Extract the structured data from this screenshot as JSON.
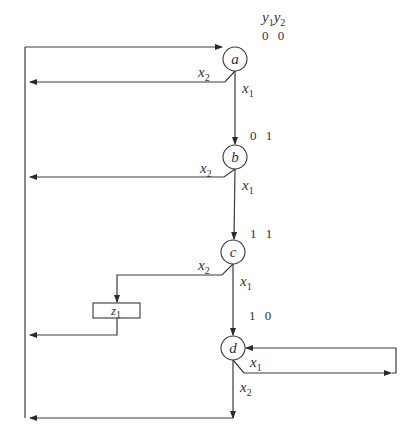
{
  "diagram": {
    "type": "ASM / state transition chart",
    "state_code_header": {
      "var1": "y",
      "sub1": "1",
      "var2": "y",
      "sub2": "2"
    },
    "states": [
      {
        "name": "a",
        "code": "0 0"
      },
      {
        "name": "b",
        "code": "0 1"
      },
      {
        "name": "c",
        "code": "1 1"
      },
      {
        "name": "d",
        "code": "1 0"
      }
    ],
    "edge_labels": {
      "a_x1": {
        "var": "x",
        "sub": "1"
      },
      "a_x2": {
        "var": "x",
        "sub": "2"
      },
      "b_x1": {
        "var": "x",
        "sub": "1"
      },
      "b_x2": {
        "var": "x",
        "sub": "2"
      },
      "c_x1": {
        "var": "x",
        "sub": "1"
      },
      "c_x2": {
        "var": "x",
        "sub": "2"
      },
      "d_x1": {
        "var": "x",
        "sub": "1"
      },
      "d_x2": {
        "var": "x",
        "sub": "2"
      }
    },
    "output_box": {
      "var": "z",
      "sub": "1"
    },
    "transitions": [
      {
        "from": "a",
        "cond": "x1",
        "to": "b"
      },
      {
        "from": "a",
        "cond": "x2",
        "to": "a"
      },
      {
        "from": "b",
        "cond": "x1",
        "to": "c"
      },
      {
        "from": "b",
        "cond": "x2",
        "to": "a"
      },
      {
        "from": "c",
        "cond": "x1",
        "to": "d"
      },
      {
        "from": "c",
        "cond": "x2",
        "output": "z1",
        "to": "a"
      },
      {
        "from": "d",
        "cond": "x1",
        "to": "d"
      },
      {
        "from": "d",
        "cond": "x2",
        "to": "a"
      }
    ]
  }
}
